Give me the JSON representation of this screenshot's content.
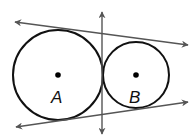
{
  "diagram": {
    "colors": {
      "circle_stroke": "#111111",
      "line_stroke": "#555555",
      "point_fill": "#000000"
    },
    "circles": [
      {
        "id": "A",
        "label": "A",
        "cx": 58,
        "cy": 75,
        "r": 45
      },
      {
        "id": "B",
        "label": "B",
        "cx": 136,
        "cy": 75,
        "r": 33
      }
    ],
    "labels": {
      "circle_a": "A",
      "circle_b": "B"
    },
    "tangent_lines": [
      {
        "name": "external-tangent-top",
        "x1": 15,
        "y1": 22,
        "x2": 188,
        "y2": 45
      },
      {
        "name": "external-tangent-bottom",
        "x1": 16,
        "y1": 127,
        "x2": 188,
        "y2": 102
      },
      {
        "name": "internal-tangent-vertical",
        "x1": 102,
        "y1": 12,
        "x2": 102,
        "y2": 134
      }
    ]
  }
}
